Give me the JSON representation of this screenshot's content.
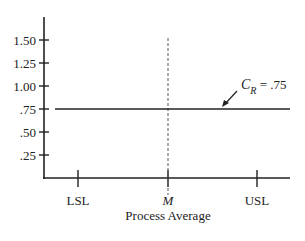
{
  "chart_data": {
    "type": "line",
    "title": "",
    "xlabel": "Process Average",
    "ylabel": "",
    "ylim": [
      0,
      1.75
    ],
    "yticks": [
      0.25,
      0.5,
      0.75,
      1.0,
      1.25,
      1.5
    ],
    "ytick_labels": [
      ".25",
      ".50",
      ".75",
      "1.00",
      "1.25",
      "1.50"
    ],
    "xticks": [
      "LSL",
      "M",
      "USL"
    ],
    "xlim": [
      "LSL-offset",
      "USL-offset"
    ],
    "grid": false,
    "series": [
      {
        "name": "C_R",
        "style": "solid",
        "y": 0.75,
        "description": "horizontal line, constant across process average"
      }
    ],
    "reference_lines": [
      {
        "name": "M",
        "orientation": "vertical",
        "style": "dashed",
        "at": "M"
      }
    ],
    "annotations": [
      {
        "text_main": "C",
        "text_sub": "R",
        "text_rest": " = .75",
        "points_to": "C_R line",
        "arrow": true
      }
    ]
  }
}
